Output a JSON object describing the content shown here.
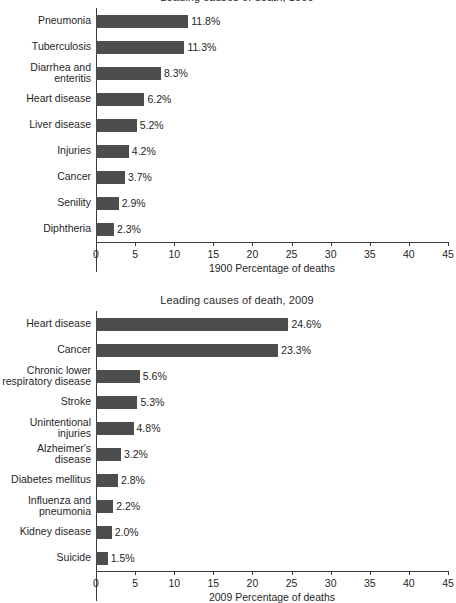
{
  "chart_data": [
    {
      "id": "1900",
      "type": "bar",
      "orientation": "horizontal",
      "title": "Leading causes of death, 1900",
      "xlabel": "1900 Percentage of deaths",
      "ylabel": "",
      "xlim": [
        0,
        45
      ],
      "xticks": [
        0,
        5,
        10,
        15,
        20,
        25,
        30,
        35,
        40,
        45
      ],
      "xtick_labels": [
        "0",
        "5",
        "10",
        "15",
        "20",
        "25",
        "30",
        "35",
        "40",
        "45"
      ],
      "grid": false,
      "legend": "none",
      "bar_color": "#4d4d4d",
      "categories": [
        "Pneumonia",
        "Tuberculosis",
        "Diarrhea and\nenteritis",
        "Heart disease",
        "Liver disease",
        "Injuries",
        "Cancer",
        "Senility",
        "Diphtheria"
      ],
      "values": [
        11.8,
        11.3,
        8.3,
        6.2,
        5.2,
        4.2,
        3.7,
        2.9,
        2.3
      ],
      "value_labels": [
        "11.8%",
        "11.3%",
        "8.3%",
        "6.2%",
        "5.2%",
        "4.2%",
        "3.7%",
        "2.9%",
        "2.3%"
      ]
    },
    {
      "id": "2009",
      "type": "bar",
      "orientation": "horizontal",
      "title": "Leading causes of death, 2009",
      "xlabel": "2009 Percentage of deaths",
      "ylabel": "",
      "xlim": [
        0,
        45
      ],
      "xticks": [
        0,
        5,
        10,
        15,
        20,
        25,
        30,
        35,
        40,
        45
      ],
      "xtick_labels": [
        "0",
        "5",
        "10",
        "15",
        "20",
        "25",
        "30",
        "35",
        "40",
        "45"
      ],
      "grid": false,
      "legend": "none",
      "bar_color": "#4d4d4d",
      "categories": [
        "Heart disease",
        "Cancer",
        "Chronic lower\nrespiratory disease",
        "Stroke",
        "Unintentional\ninjuries",
        "Alzheimer's\ndisease",
        "Diabetes mellitus",
        "Influenza and\npneumonia",
        "Kidney disease",
        "Suicide"
      ],
      "values": [
        24.6,
        23.3,
        5.6,
        5.3,
        4.8,
        3.2,
        2.8,
        2.2,
        2.0,
        1.5
      ],
      "value_labels": [
        "24.6%",
        "23.3%",
        "5.6%",
        "5.3%",
        "4.8%",
        "3.2%",
        "2.8%",
        "2.2%",
        "2.0%",
        "1.5%"
      ]
    }
  ]
}
